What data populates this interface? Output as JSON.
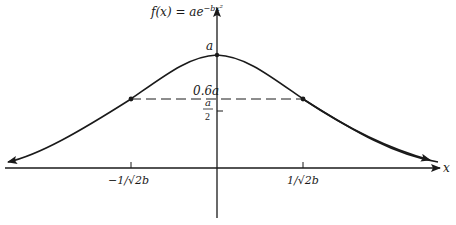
{
  "diagram": {
    "function_label": "f(x) = ae^{-bx²}",
    "function_label_parts": {
      "lhs": "f(x) = ae",
      "exponent": "−bx²"
    },
    "x_axis_label": "x",
    "peak_label": "a",
    "level_labels": {
      "sixty_percent": "0.6a",
      "half_numerator": "a",
      "half_denominator": "2"
    },
    "x_tick_labels": {
      "left": "−1/√2b",
      "right": "1/√2b"
    },
    "colors": {
      "stroke": "#1a1a1a",
      "background": "#ffffff"
    }
  }
}
